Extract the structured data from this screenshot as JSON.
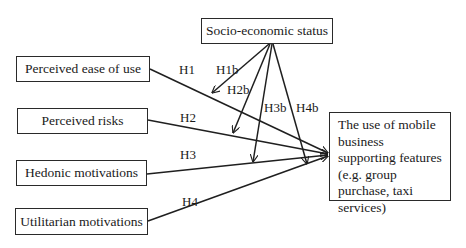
{
  "diagram": {
    "moderator": {
      "id": "ses",
      "label": "Socio-economic status"
    },
    "independent_variables": [
      {
        "id": "peou",
        "label": "Perceived ease of use"
      },
      {
        "id": "pr",
        "label": "Perceived risks"
      },
      {
        "id": "hm",
        "label": "Hedonic motivations"
      },
      {
        "id": "um",
        "label": "Utilitarian motivations"
      }
    ],
    "dependent_variable": {
      "id": "use",
      "label": "The use of mobile business supporting features (e.g. group purchase, taxi services)"
    },
    "hypotheses": {
      "direct": [
        {
          "label": "H1",
          "from": "peou",
          "to": "use"
        },
        {
          "label": "H2",
          "from": "pr",
          "to": "use"
        },
        {
          "label": "H3",
          "from": "hm",
          "to": "use"
        },
        {
          "label": "H4",
          "from": "um",
          "to": "use"
        }
      ],
      "moderating": [
        {
          "label": "H1b",
          "from": "ses",
          "to": "H1"
        },
        {
          "label": "H2b",
          "from": "ses",
          "to": "H2"
        },
        {
          "label": "H3b",
          "from": "ses",
          "to": "H3"
        },
        {
          "label": "H4b",
          "from": "ses",
          "to": "H4"
        }
      ]
    }
  }
}
